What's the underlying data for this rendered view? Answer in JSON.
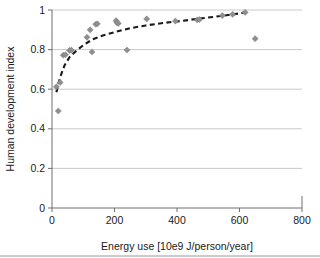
{
  "chart_data": {
    "type": "scatter",
    "title": "",
    "xlabel": "Energy use [10e9 J/person/year]",
    "ylabel": "Human development index",
    "xlim": [
      0,
      800
    ],
    "ylim": [
      0,
      1
    ],
    "xticks": [
      0,
      200,
      400,
      600,
      800
    ],
    "yticks": [
      0,
      0.2,
      0.4,
      0.6,
      0.8,
      1
    ],
    "xtick_labels": [
      "0",
      "200",
      "400",
      "600",
      "800"
    ],
    "ytick_labels": [
      "0",
      "0.2",
      "0.4",
      "0.6",
      "0.8",
      "1"
    ],
    "grid": "horizontal",
    "legend": "none",
    "marker_shape": "diamond",
    "marker_color": "#8f8f8f",
    "trend_color": "#1a1a1a",
    "trend_style": "dashed",
    "points": [
      {
        "x": 14,
        "y": 0.612
      },
      {
        "x": 20,
        "y": 0.49
      },
      {
        "x": 26,
        "y": 0.634
      },
      {
        "x": 36,
        "y": 0.772
      },
      {
        "x": 43,
        "y": 0.774
      },
      {
        "x": 56,
        "y": 0.796
      },
      {
        "x": 62,
        "y": 0.797
      },
      {
        "x": 112,
        "y": 0.862
      },
      {
        "x": 122,
        "y": 0.9
      },
      {
        "x": 128,
        "y": 0.788
      },
      {
        "x": 140,
        "y": 0.928
      },
      {
        "x": 145,
        "y": 0.93
      },
      {
        "x": 205,
        "y": 0.946
      },
      {
        "x": 208,
        "y": 0.936
      },
      {
        "x": 212,
        "y": 0.932
      },
      {
        "x": 240,
        "y": 0.798
      },
      {
        "x": 303,
        "y": 0.955
      },
      {
        "x": 395,
        "y": 0.944
      },
      {
        "x": 465,
        "y": 0.95
      },
      {
        "x": 472,
        "y": 0.952
      },
      {
        "x": 545,
        "y": 0.972
      },
      {
        "x": 578,
        "y": 0.978
      },
      {
        "x": 618,
        "y": 0.988
      },
      {
        "x": 650,
        "y": 0.855
      }
    ],
    "trend_line": [
      {
        "x": 14,
        "y": 0.585
      },
      {
        "x": 26,
        "y": 0.66
      },
      {
        "x": 40,
        "y": 0.72
      },
      {
        "x": 56,
        "y": 0.762
      },
      {
        "x": 75,
        "y": 0.79
      },
      {
        "x": 100,
        "y": 0.822
      },
      {
        "x": 130,
        "y": 0.852
      },
      {
        "x": 165,
        "y": 0.872
      },
      {
        "x": 205,
        "y": 0.89
      },
      {
        "x": 250,
        "y": 0.908
      },
      {
        "x": 300,
        "y": 0.922
      },
      {
        "x": 360,
        "y": 0.935
      },
      {
        "x": 420,
        "y": 0.946
      },
      {
        "x": 480,
        "y": 0.958
      },
      {
        "x": 540,
        "y": 0.97
      },
      {
        "x": 580,
        "y": 0.978
      },
      {
        "x": 620,
        "y": 0.988
      }
    ]
  }
}
